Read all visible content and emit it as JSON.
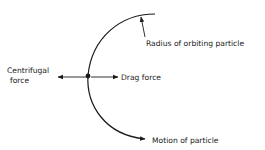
{
  "diagram": {
    "labels": {
      "radius": "Radius of orbiting particle",
      "centrifugal_line1": "Centrifugal",
      "centrifugal_line2": "force",
      "drag": "Drag force",
      "motion": "Motion of particle"
    },
    "colors": {
      "stroke": "#1a1a1a",
      "background": "#ffffff"
    }
  }
}
